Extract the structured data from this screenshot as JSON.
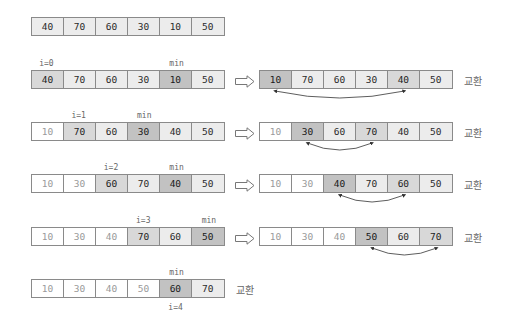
{
  "initial": {
    "values": [
      "40",
      "70",
      "60",
      "30",
      "10",
      "50"
    ],
    "shades": [
      "l",
      "l",
      "l",
      "l",
      "l",
      "l"
    ]
  },
  "steps": [
    {
      "i_label": "i=0",
      "min_label": "min",
      "i_index": 0,
      "min_index": 4,
      "before": {
        "values": [
          "40",
          "70",
          "60",
          "30",
          "10",
          "50"
        ],
        "shades": [
          "m",
          "l",
          "l",
          "l",
          "d",
          "l"
        ]
      },
      "after": {
        "values": [
          "10",
          "70",
          "60",
          "30",
          "40",
          "50"
        ],
        "shades": [
          "d",
          "l",
          "l",
          "l",
          "m",
          "l"
        ]
      },
      "swap_label": "교환"
    },
    {
      "i_label": "i=1",
      "min_label": "min",
      "i_index": 1,
      "min_index": 3,
      "before": {
        "values": [
          "10",
          "70",
          "60",
          "30",
          "40",
          "50"
        ],
        "shades": [
          "w",
          "m",
          "l",
          "d",
          "l",
          "l"
        ]
      },
      "after": {
        "values": [
          "10",
          "30",
          "60",
          "70",
          "40",
          "50"
        ],
        "shades": [
          "w",
          "d",
          "l",
          "m",
          "l",
          "l"
        ]
      },
      "swap_label": "교환"
    },
    {
      "i_label": "i=2",
      "min_label": "min",
      "i_index": 2,
      "min_index": 4,
      "before": {
        "values": [
          "10",
          "30",
          "60",
          "70",
          "40",
          "50"
        ],
        "shades": [
          "w",
          "w",
          "m",
          "l",
          "d",
          "l"
        ]
      },
      "after": {
        "values": [
          "10",
          "30",
          "40",
          "70",
          "60",
          "50"
        ],
        "shades": [
          "w",
          "w",
          "d",
          "l",
          "m",
          "l"
        ]
      },
      "swap_label": "교환"
    },
    {
      "i_label": "i=3",
      "min_label": "min",
      "i_index": 3,
      "min_index": 5,
      "before": {
        "values": [
          "10",
          "30",
          "40",
          "70",
          "60",
          "50"
        ],
        "shades": [
          "w",
          "w",
          "w",
          "m",
          "l",
          "d"
        ]
      },
      "after": {
        "values": [
          "10",
          "30",
          "40",
          "50",
          "60",
          "70"
        ],
        "shades": [
          "w",
          "w",
          "w",
          "d",
          "l",
          "m"
        ]
      },
      "swap_label": "교환"
    }
  ],
  "final": {
    "i_label": "i=4",
    "min_label": "min",
    "index": 4,
    "values": [
      "10",
      "30",
      "40",
      "50",
      "60",
      "70"
    ],
    "shades": [
      "w",
      "w",
      "w",
      "w",
      "d",
      "l"
    ],
    "swap_label": "교환"
  }
}
